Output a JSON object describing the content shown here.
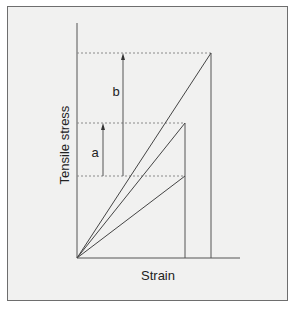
{
  "diagram": {
    "title": "",
    "axes": {
      "y_label": "Tensile stress",
      "x_label": "Strain"
    },
    "annotations": {
      "a": "a",
      "b": "b"
    },
    "lines": [
      {
        "name": "steep-line",
        "from": [
          77,
          258
        ],
        "to": [
          211,
          53
        ]
      },
      {
        "name": "middle-line",
        "from": [
          77,
          258
        ],
        "to": [
          185,
          123
        ]
      },
      {
        "name": "shallow-line",
        "from": [
          77,
          258
        ],
        "to": [
          185,
          176
        ]
      }
    ],
    "levels": {
      "upper": 53,
      "middle": 123,
      "lower": 176
    },
    "colors": {
      "background": "#f1f1f0",
      "line": "#4a4a4a",
      "dashed": "#8a8a8a"
    }
  }
}
